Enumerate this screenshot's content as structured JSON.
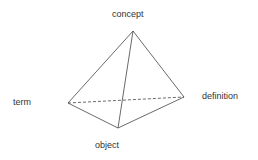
{
  "diagram": {
    "type": "tetrahedron",
    "colors": {
      "edge": "#444444",
      "label": "#333333",
      "background": "#ffffff"
    },
    "vertices": {
      "concept": {
        "label": "concept",
        "x": 133,
        "y": 31
      },
      "term": {
        "label": "term",
        "x": 68,
        "y": 103
      },
      "definition": {
        "label": "definition",
        "x": 184,
        "y": 97
      },
      "object": {
        "label": "object",
        "x": 118,
        "y": 128
      }
    },
    "edges": [
      {
        "from": "concept",
        "to": "term",
        "style": "solid"
      },
      {
        "from": "concept",
        "to": "definition",
        "style": "solid"
      },
      {
        "from": "concept",
        "to": "object",
        "style": "solid"
      },
      {
        "from": "term",
        "to": "object",
        "style": "solid"
      },
      {
        "from": "object",
        "to": "definition",
        "style": "solid"
      },
      {
        "from": "term",
        "to": "definition",
        "style": "dashed"
      }
    ]
  }
}
